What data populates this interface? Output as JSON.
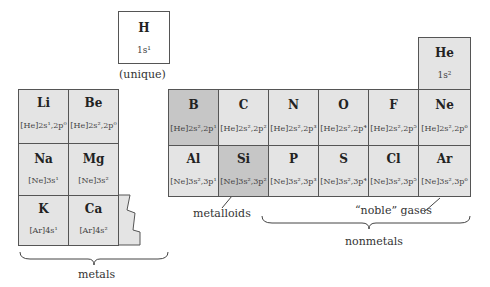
{
  "hydrogen": {
    "symbol": "H",
    "config": "1s¹",
    "label": "(unique)"
  },
  "helium": {
    "symbol": "He",
    "config": "1s²"
  },
  "metals_group": {
    "rows": [
      [
        {
          "symbol": "Li",
          "config": "[He]2s¹,2p⁰"
        },
        {
          "symbol": "Be",
          "config": "[He]2s²,2p⁰"
        }
      ],
      [
        {
          "symbol": "Na",
          "config": "[Ne]3s¹"
        },
        {
          "symbol": "Mg",
          "config": "[Ne]3s²"
        }
      ],
      [
        {
          "symbol": "K",
          "config": "[Ar]4s¹"
        },
        {
          "symbol": "Ca",
          "config": "[Ar]4s²"
        }
      ]
    ],
    "label": "metals"
  },
  "p_block": {
    "rows": [
      [
        {
          "symbol": "B",
          "config": "[He]2s²,2p¹"
        },
        {
          "symbol": "C",
          "config": "[He]2s²,2p²"
        },
        {
          "symbol": "N",
          "config": "[He]2s²,2p³"
        },
        {
          "symbol": "O",
          "config": "[He]2s²,2p⁴"
        },
        {
          "symbol": "F",
          "config": "[He]2s²,2p⁵"
        },
        {
          "symbol": "Ne",
          "config": "[He]2s²,2p⁶"
        }
      ],
      [
        {
          "symbol": "Al",
          "config": "[Ne]3s²,3p¹"
        },
        {
          "symbol": "Si",
          "config": "[Ne]3s²,3p²"
        },
        {
          "symbol": "P",
          "config": "[Ne]3s²,3p³"
        },
        {
          "symbol": "S",
          "config": "[Ne]3s²,3p⁴"
        },
        {
          "symbol": "Cl",
          "config": "[Ne]3s²,3p⁵"
        },
        {
          "symbol": "Ar",
          "config": "[Ne]3s²,3p⁶"
        }
      ]
    ]
  },
  "labels": {
    "metalloids": "metalloids",
    "noble_gases": "“noble” gases",
    "nonmetals": "nonmetals"
  },
  "colors": {
    "cell": "#e4e4e4",
    "metalloid": "#c6c6c6",
    "border": "#555555"
  }
}
